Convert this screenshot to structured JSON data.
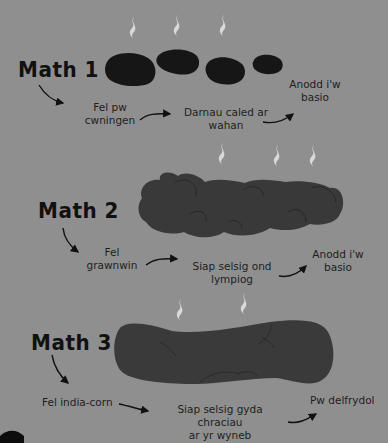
{
  "colors": {
    "background": "#8f8f8f",
    "stool_type1": "#161616",
    "stool_type2": "#393939",
    "stool_type3": "#3a3a3a",
    "steam": "#d9d9d9",
    "text": "#1e1e1e"
  },
  "types": [
    {
      "title": "Math 1",
      "description": "Fel pw cwningen",
      "description_lines": [
        "Fel pw",
        "cwningen"
      ],
      "shape": "Darnau caled ar wahan",
      "shape_lines": [
        "Darnau caled ar",
        "wahan"
      ],
      "result": "Anodd i'w basio",
      "result_lines": [
        "Anodd i'w",
        "basio"
      ]
    },
    {
      "title": "Math 2",
      "description": "Fel grawnwin",
      "description_lines": [
        "Fel",
        "grawnwin"
      ],
      "shape": "Siap selsig ond lympiog",
      "shape_lines": [
        "Siap selsig ond",
        "lympiog"
      ],
      "result": "Anodd i'w basio",
      "result_lines": [
        "Anodd i'w",
        "basio"
      ]
    },
    {
      "title": "Math 3",
      "description": "Fel india-corn",
      "description_lines": [
        "Fel india-corn"
      ],
      "shape": "Siap selsig gyda chraciau ar yr wyneb",
      "shape_lines": [
        "Siap selsig gyda chraciau",
        "ar yr wyneb"
      ],
      "result": "Pw delfrydol",
      "result_lines": [
        "Pw delfrydol"
      ]
    }
  ],
  "icons": [
    "steam-icon",
    "arrow-icon",
    "stool-illustration"
  ]
}
